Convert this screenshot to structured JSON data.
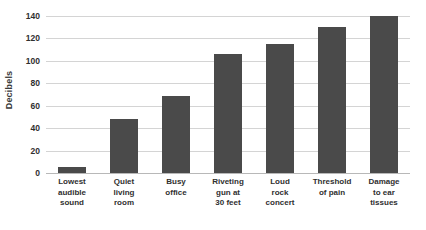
{
  "chart_data": {
    "type": "bar",
    "title": "",
    "xlabel": "",
    "ylabel": "Decibels",
    "ylim": [
      0,
      140
    ],
    "grid": true,
    "legend": false,
    "orientation": "vertical",
    "bar_color": "#4a4a4a",
    "gridline_color": "#d4d4d4",
    "axis_color": "#b8b8b8",
    "yticks": [
      0,
      20,
      40,
      60,
      80,
      100,
      120,
      140
    ],
    "ytick_labels": [
      "0",
      "20",
      "40",
      "60",
      "80",
      "100",
      "120",
      "140"
    ],
    "categories": [
      "Lowest audible sound",
      "Quiet living room",
      "Busy office",
      "Riveting gun at 30 feet",
      "Loud rock concert",
      "Threshold of pain",
      "Damage to ear tissues"
    ],
    "category_lines": [
      [
        "Lowest",
        "audible",
        "sound"
      ],
      [
        "Quiet",
        "living",
        "room"
      ],
      [
        "Busy",
        "office"
      ],
      [
        "Riveting",
        "gun at",
        "30 feet"
      ],
      [
        "Loud",
        "rock",
        "concert"
      ],
      [
        "Threshold",
        "of pain"
      ],
      [
        "Damage",
        "to ear",
        "tissues"
      ]
    ],
    "values": [
      5,
      48,
      69,
      106,
      115,
      130,
      140
    ]
  }
}
